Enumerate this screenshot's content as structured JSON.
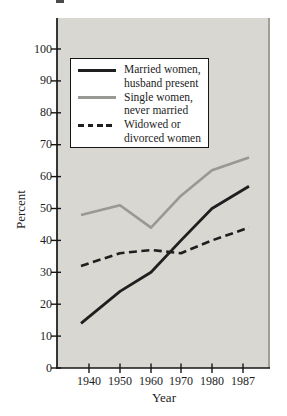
{
  "chart_data": {
    "type": "line",
    "title": "",
    "xlabel": "Year",
    "ylabel": "Percent",
    "x": [
      1940,
      1950,
      1960,
      1970,
      1980,
      1987
    ],
    "x_tick_labels": [
      "1940",
      "1950",
      "1960",
      "1970",
      "1980",
      "1987"
    ],
    "y_ticks": [
      "0",
      "10",
      "20",
      "30",
      "40",
      "50",
      "60",
      "70",
      "80",
      "90",
      "100"
    ],
    "ylim": [
      0,
      100
    ],
    "grid": false,
    "legend_position": "upper-left-inside",
    "series": [
      {
        "name": "Married women, husband present",
        "legend_lines": [
          "Married women,",
          "husband present"
        ],
        "line_style": "solid",
        "color": "#1f1f1f",
        "values": [
          14,
          24,
          30,
          40,
          50,
          57
        ]
      },
      {
        "name": "Single women, never married",
        "legend_lines": [
          "Single women,",
          "never married"
        ],
        "line_style": "solid",
        "color": "#9a9894",
        "values": [
          48,
          51,
          44,
          54,
          62,
          66
        ]
      },
      {
        "name": "Widowed or divorced women",
        "legend_lines": [
          "Widowed or",
          "divorced women"
        ],
        "line_style": "dashed",
        "color": "#1f1f1f",
        "values": [
          32,
          36,
          37,
          36,
          40,
          44
        ]
      }
    ],
    "colors": {
      "panel_bg": "#d8d7d2",
      "panel_edge": "#a19e98",
      "axis": "#161616",
      "text": "#1d1d1d",
      "legend_bg": "#ffffff",
      "legend_border": "#161616"
    }
  }
}
